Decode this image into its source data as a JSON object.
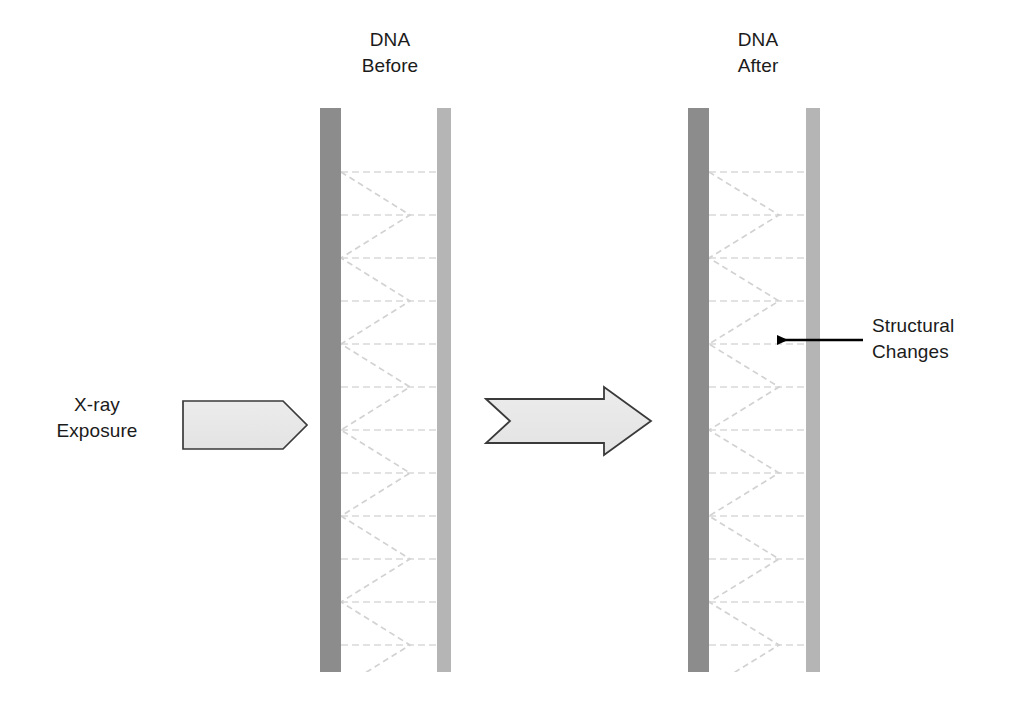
{
  "figure": {
    "background_color": "#ffffff",
    "width": 1012,
    "height": 705
  },
  "labels": {
    "dna_before": "DNA\nBefore",
    "dna_after": "DNA\nAfter",
    "xray_exposure": "X-ray\nExposure",
    "structural_changes": "Structural\nChanges"
  },
  "colors": {
    "strand_dark": "#8c8c8c",
    "strand_light": "#b5b5b5",
    "rung": "#d9d9d9",
    "helix": "#d2d2d2",
    "arrow_fill": "#e8e8e8",
    "arrow_stroke": "#3a3a3a",
    "pointer_arrow": "#000000",
    "text": "#1b1b1b"
  },
  "elements": {
    "dna_before": {
      "name": "DNA Before",
      "left_strand": {
        "x": 320,
        "y": 108,
        "width": 21,
        "height": 564,
        "color": "#8c8c8c"
      },
      "right_strand": {
        "x": 437,
        "y": 108,
        "width": 14,
        "height": 564,
        "color": "#b5b5b5"
      },
      "rung_count": 12,
      "rung_spacing": 43
    },
    "dna_after": {
      "name": "DNA After",
      "left_strand": {
        "x": 688,
        "y": 108,
        "width": 21,
        "height": 564,
        "color": "#8c8c8c"
      },
      "right_strand": {
        "x": 806,
        "y": 108,
        "width": 14,
        "height": 564,
        "color": "#b5b5b5"
      },
      "rung_count": 12,
      "rung_spacing": 43
    },
    "xray_arrow": {
      "name": "X-ray exposure pentagon arrow",
      "shape": "pentagon-right",
      "x": 182,
      "y": 400,
      "width": 125,
      "height": 50
    },
    "transform_arrow": {
      "name": "Transformation striped arrow",
      "shape": "striped-right-arrow",
      "x": 485,
      "y": 398,
      "width": 166,
      "height": 46
    },
    "callout_arrow": {
      "name": "Structural changes pointer",
      "shape": "line-arrow-left",
      "from_x": 863,
      "to_x": 765,
      "y": 340
    }
  }
}
